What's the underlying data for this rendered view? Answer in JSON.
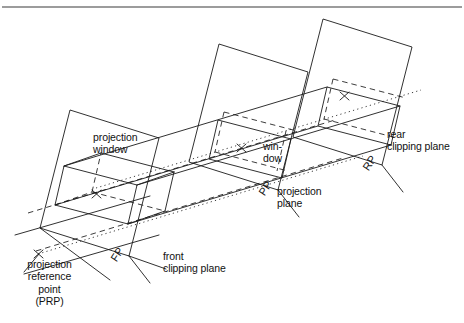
{
  "figure": {
    "background_color": "#ffffff",
    "line_color": "#1a1a1a",
    "width": 464,
    "height": 323
  },
  "labels": {
    "projection_window": "projection\nwindow",
    "window_hyphen": "win-\ndow",
    "projection_plane": "projection\nplane",
    "rear_clipping_plane": "rear\nclipping plane",
    "front_clipping_plane": "front\nclipping plane",
    "projection_reference_point": "projection\nreference\npoint\n(PRP)",
    "fp_tag": "FP",
    "pp_tag": "PP",
    "rp_tag": "RP"
  },
  "markers": {
    "prp_cross": "×",
    "front_window_cross": "×",
    "mid_window_cross": "×",
    "rear_window_cross": "×"
  }
}
